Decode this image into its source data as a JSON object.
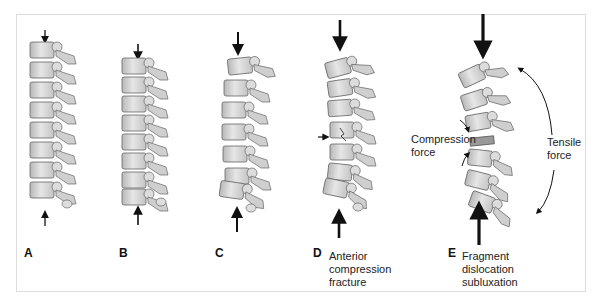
{
  "figure": {
    "panels": [
      {
        "id": "A",
        "label": "A",
        "caption": []
      },
      {
        "id": "B",
        "label": "B",
        "caption": []
      },
      {
        "id": "C",
        "label": "C",
        "caption": []
      },
      {
        "id": "D",
        "label": "D",
        "caption": [
          "Anterior",
          "compression",
          "fracture"
        ]
      },
      {
        "id": "E",
        "label": "E",
        "caption": [
          "Fragment",
          "dislocation",
          "subluxation"
        ]
      }
    ],
    "annotations": {
      "compression": [
        "Compression",
        "force"
      ],
      "tensile": [
        "Tensile",
        "force"
      ]
    },
    "colors": {
      "bone_fill": "#d9d9d9",
      "bone_shadow": "#a8a8a8",
      "outline": "#555555",
      "arrow": "#111111",
      "frame": "#dcdcdc"
    }
  }
}
